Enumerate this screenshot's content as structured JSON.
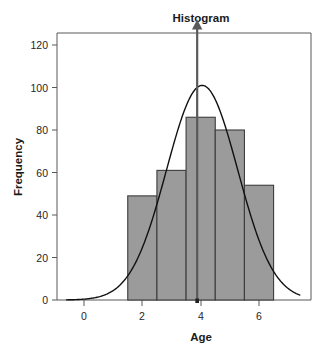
{
  "chart_data": {
    "type": "bar",
    "title": "Histogram",
    "xlabel": "Age",
    "ylabel": "Frequency",
    "categories": [
      "1.5-2.5",
      "2.5-3.5",
      "3.5-4.5",
      "4.5-5.5",
      "5.5-6.5"
    ],
    "bin_edges": [
      1.5,
      2.5,
      3.5,
      4.5,
      5.5,
      6.5
    ],
    "values": [
      49,
      61,
      86,
      80,
      54
    ],
    "xlim": [
      -0.6,
      7.4
    ],
    "ylim": [
      0,
      126
    ],
    "xticks": [
      0,
      2,
      4,
      6
    ],
    "xtick_labels": [
      "0",
      "2",
      "4",
      "6"
    ],
    "yticks": [
      0,
      20,
      40,
      60,
      80,
      100,
      120
    ],
    "ytick_labels": [
      "0",
      "20",
      "40",
      "60",
      "80",
      "100",
      "120"
    ],
    "grid": false,
    "legend": false,
    "series": [
      {
        "name": "Frequency",
        "type": "bar",
        "values": [
          49,
          61,
          86,
          80,
          54
        ]
      },
      {
        "name": "Normal curve",
        "type": "line",
        "peak_value": 101,
        "peak_x": 4.05,
        "std_dev": 1.22
      }
    ],
    "annotations": [
      {
        "name": "mean-arrow",
        "type": "vertical-arrow",
        "x": 3.88,
        "y_from": 0,
        "y_to": 132,
        "direction": "up"
      }
    ],
    "colors": {
      "bar_fill": "#9b9b9b",
      "bar_stroke": "#3d3d3d",
      "curve": "#111111",
      "arrow": "#5a5a5a",
      "frame": "#595959",
      "text": "#1a1a1a",
      "background": "#ffffff"
    }
  }
}
